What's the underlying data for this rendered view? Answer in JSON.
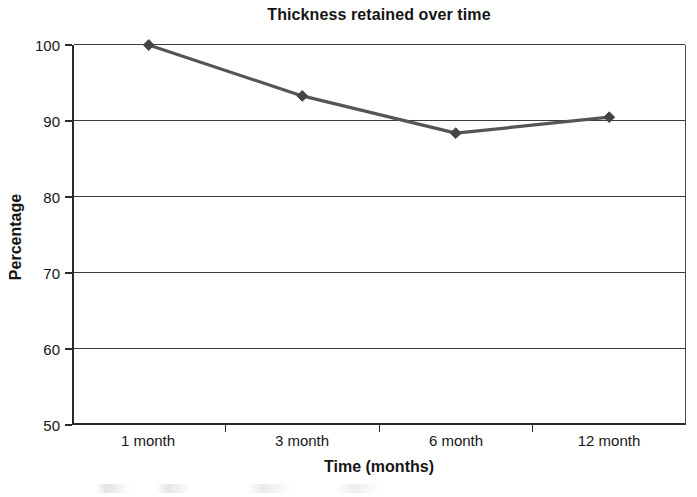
{
  "chart_data": {
    "type": "line",
    "title": "Thickness retained over time",
    "xlabel": "Time (months)",
    "ylabel": "Percentage",
    "categories": [
      "1 month",
      "3 month",
      "6 month",
      "12 month"
    ],
    "values": [
      100.0,
      93.3,
      88.4,
      90.5
    ],
    "ylim": [
      50,
      100
    ],
    "yticks": [
      50,
      60,
      70,
      80,
      90,
      100
    ],
    "ytick_labels": [
      "50",
      "60",
      "70",
      "80",
      "90",
      "100"
    ],
    "grid": "horizontal",
    "legend": "none",
    "series": [
      {
        "name": "Thickness retained",
        "values": [
          100.0,
          93.3,
          88.4,
          90.5
        ],
        "marker": "diamond",
        "line_color": "#555555",
        "marker_color": "#444444"
      }
    ],
    "colors": {
      "line": "#555555",
      "marker": "#444444",
      "axis": "#2a2a2a",
      "grid": "#3c3c3c",
      "text": "#161616",
      "background": "#ffffff"
    }
  }
}
